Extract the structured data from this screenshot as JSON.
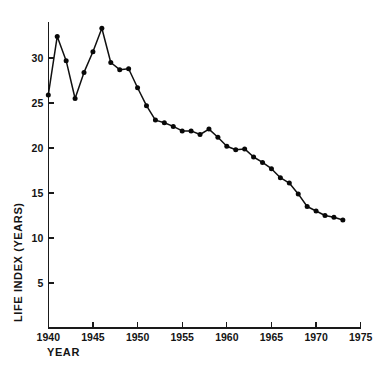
{
  "chart_data": {
    "type": "line",
    "title": "",
    "xlabel": "YEAR",
    "ylabel": "LIFE INDEX (YEARS)",
    "xlim": [
      1940,
      1975
    ],
    "ylim": [
      0,
      35
    ],
    "grid": false,
    "legend": "none",
    "xticks": [
      1940,
      1945,
      1950,
      1955,
      1960,
      1965,
      1970,
      1975
    ],
    "xtick_labels": [
      "1940",
      "1945",
      "1950",
      "1955",
      "1960",
      "1965",
      "1970",
      "1975"
    ],
    "yticks": [
      5,
      10,
      15,
      20,
      25,
      30
    ],
    "ytick_labels": [
      "5",
      "10",
      "15",
      "20",
      "25",
      "30"
    ],
    "series": [
      {
        "name": "Life Index",
        "marker": "filled-circle",
        "color": "#0d0d0d",
        "x": [
          1940,
          1941,
          1942,
          1943,
          1944,
          1945,
          1946,
          1947,
          1948,
          1949,
          1950,
          1951,
          1952,
          1953,
          1954,
          1955,
          1956,
          1957,
          1958,
          1959,
          1960,
          1961,
          1962,
          1963,
          1964,
          1965,
          1966,
          1967,
          1968,
          1969,
          1970,
          1971,
          1972,
          1973
        ],
        "values": [
          25.9,
          32.4,
          29.7,
          25.5,
          28.4,
          30.7,
          33.3,
          29.5,
          28.7,
          28.8,
          26.7,
          24.7,
          23.1,
          22.8,
          22.4,
          21.9,
          21.9,
          21.5,
          22.1,
          21.2,
          20.2,
          19.8,
          19.9,
          19.0,
          18.4,
          17.7,
          16.7,
          16.1,
          14.9,
          13.5,
          13.0,
          12.5,
          12.3,
          12.0
        ]
      }
    ]
  }
}
